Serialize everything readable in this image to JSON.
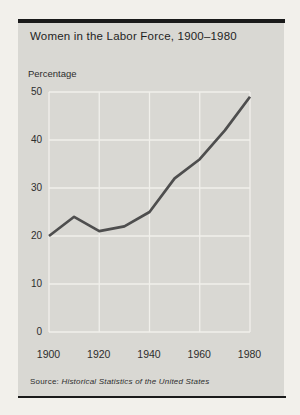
{
  "page": {
    "source_label": "Source:"
  },
  "colors": {
    "page_bg": "#f2f0eb",
    "card_bg": "#d9d8d3",
    "bar": "#1a1a1a",
    "grid": "#f1f0eb",
    "line": "#4e4e4e",
    "text": "#1f1f1f",
    "tick_text": "#2d2d2d"
  },
  "chart_data": {
    "type": "line",
    "title": "Women in the Labor Force, 1900–1980",
    "ylabel": "Percentage",
    "xlabel": "",
    "x": [
      1900,
      1910,
      1920,
      1930,
      1940,
      1950,
      1960,
      1970,
      1980
    ],
    "series": [
      {
        "name": "Women in the labor force (percentage)",
        "values": [
          20,
          24,
          21,
          22,
          25,
          32,
          36,
          42,
          49
        ]
      }
    ],
    "xlim": [
      1900,
      1980
    ],
    "ylim": [
      0,
      50
    ],
    "x_ticks": [
      1900,
      1920,
      1940,
      1960,
      1980
    ],
    "y_ticks": [
      0,
      10,
      20,
      30,
      40,
      50
    ],
    "grid": true,
    "legend": "none",
    "source": "Historical Statistics of the United States"
  }
}
